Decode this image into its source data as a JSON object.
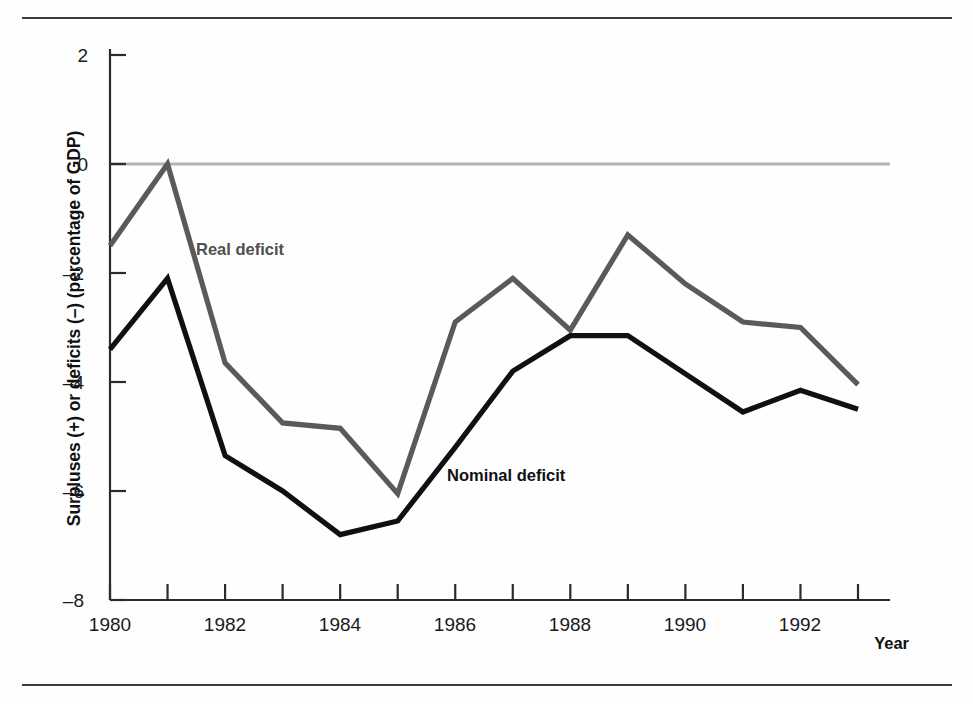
{
  "chart_data": {
    "type": "line",
    "title": "",
    "xlabel": "Year",
    "ylabel": "Surpluses (+) or deficits (–) (percentage of GDP)",
    "x": [
      1980,
      1981,
      1982,
      1983,
      1984,
      1985,
      1986,
      1987,
      1988,
      1989,
      1990,
      1991,
      1992,
      1993
    ],
    "xlim": [
      1980,
      1993
    ],
    "ylim": [
      -8,
      2
    ],
    "yticks": [
      2,
      0,
      -2,
      -4,
      -6,
      -8
    ],
    "ytick_labels": [
      "2",
      "0",
      "–2",
      "–4",
      "–6",
      "–8"
    ],
    "xticks": [
      1980,
      1981,
      1982,
      1983,
      1984,
      1985,
      1986,
      1987,
      1988,
      1989,
      1990,
      1991,
      1992,
      1993
    ],
    "xtick_labels": [
      "1980",
      "",
      "1982",
      "",
      "1984",
      "",
      "1986",
      "",
      "1988",
      "",
      "1990",
      "",
      "1992",
      ""
    ],
    "xtick_labels_shown": [
      "1980",
      "1982",
      "1984",
      "1986",
      "1988",
      "1990",
      "1992"
    ],
    "grid": false,
    "zero_line": true,
    "legend": "inline-annotations",
    "series": [
      {
        "name": "Real deficit",
        "color": "#5a5a5a",
        "values": [
          -1.5,
          0.0,
          -3.65,
          -4.75,
          -4.85,
          -6.05,
          -2.9,
          -2.1,
          -3.05,
          -1.3,
          -2.2,
          -2.9,
          -3.0,
          -4.05
        ]
      },
      {
        "name": "Nominal deficit",
        "color": "#101010",
        "values": [
          -3.4,
          -2.1,
          -5.35,
          -6.0,
          -6.8,
          -6.55,
          -5.2,
          -3.8,
          -3.15,
          -3.15,
          -3.85,
          -4.55,
          -4.15,
          -4.5
        ]
      }
    ],
    "annotations": [
      {
        "text": "Real deficit",
        "x": 1981.5,
        "y": -1.45
      },
      {
        "text": "Nominal deficit",
        "x": 1985.9,
        "y": -5.55
      }
    ]
  },
  "axis": {
    "x_title": "Year"
  }
}
